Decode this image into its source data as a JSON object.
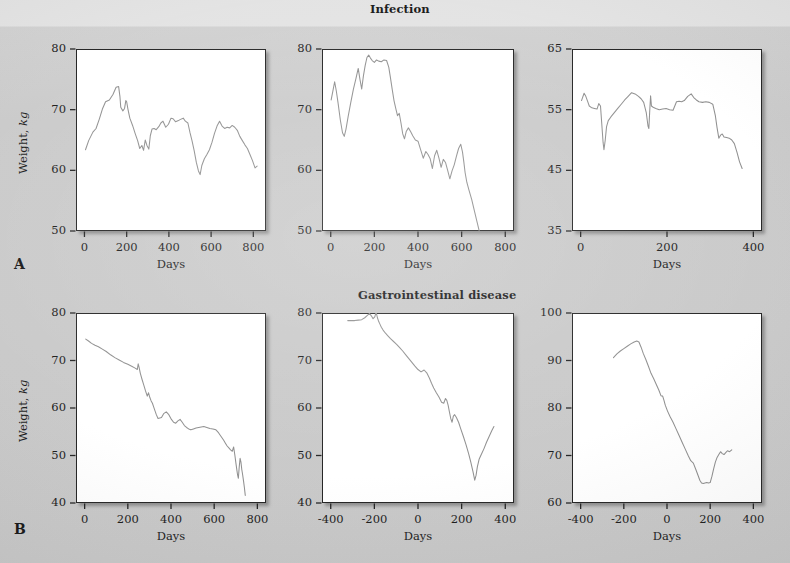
{
  "figure": {
    "background_color": "#c8c8c8",
    "series_color": "#8a8a8a",
    "frame_color": "#1b1b1b"
  },
  "sections": [
    {
      "id": "A",
      "label": "A",
      "title": "Infection"
    },
    {
      "id": "B",
      "label": "B",
      "title": "Gastrointestinal disease"
    }
  ],
  "axis_titles": {
    "x": "Days",
    "y_prefix": "Weight, ",
    "y_italic": "kg"
  },
  "chart_data": [
    {
      "id": "A1",
      "type": "line",
      "title": "",
      "section": "A",
      "xlabel": "Days",
      "ylabel": "Weight, kg",
      "xlim": [
        -40,
        860
      ],
      "ylim": [
        50,
        80
      ],
      "xticks": [
        0,
        200,
        400,
        600,
        800
      ],
      "yticks": [
        50,
        60,
        70,
        80
      ],
      "grid": false,
      "x": [
        5,
        20,
        40,
        55,
        70,
        85,
        100,
        118,
        135,
        150,
        162,
        168,
        172,
        182,
        190,
        196,
        200,
        206,
        215,
        228,
        240,
        252,
        262,
        272,
        280,
        288,
        296,
        305,
        312,
        320,
        330,
        340,
        352,
        362,
        372,
        385,
        398,
        410,
        420,
        432,
        445,
        455,
        468,
        478,
        490,
        500,
        510,
        520,
        530,
        540,
        548,
        556,
        568,
        580,
        592,
        604,
        616,
        628,
        640,
        652,
        664,
        676,
        688,
        700,
        712,
        724,
        736,
        748,
        760,
        772,
        784,
        796,
        808,
        818
      ],
      "y": [
        63.4,
        64.9,
        66.3,
        66.9,
        68.4,
        70.1,
        71.3,
        71.6,
        72.5,
        73.7,
        73.8,
        72.2,
        70.4,
        69.8,
        70.2,
        71.5,
        71.3,
        70.1,
        68.6,
        67.4,
        66.1,
        64.9,
        63.6,
        64.1,
        63.3,
        65.0,
        64.1,
        63.5,
        65.7,
        66.8,
        66.9,
        66.7,
        67.2,
        67.8,
        68.1,
        67.1,
        67.6,
        68.6,
        68.5,
        68.0,
        68.2,
        68.4,
        68.6,
        68.1,
        67.8,
        66.2,
        64.8,
        63.2,
        61.3,
        59.9,
        59.3,
        60.8,
        61.9,
        62.6,
        63.4,
        64.6,
        66.1,
        67.3,
        68.1,
        67.3,
        66.9,
        67.1,
        67.0,
        67.4,
        67.1,
        66.6,
        65.6,
        64.9,
        64.2,
        63.6,
        62.6,
        61.6,
        60.4,
        60.7
      ]
    },
    {
      "id": "A2",
      "type": "line",
      "title": "Infection",
      "section": "A",
      "xlabel": "Days",
      "ylabel": "",
      "xlim": [
        -40,
        840
      ],
      "ylim": [
        50,
        80
      ],
      "xticks": [
        0,
        200,
        400,
        600,
        800
      ],
      "yticks": [
        50,
        60,
        70,
        80
      ],
      "grid": false,
      "x": [
        2,
        10,
        18,
        26,
        34,
        44,
        54,
        62,
        70,
        80,
        92,
        104,
        116,
        126,
        134,
        142,
        150,
        158,
        166,
        174,
        182,
        190,
        200,
        210,
        220,
        232,
        244,
        256,
        266,
        274,
        282,
        290,
        298,
        306,
        314,
        322,
        330,
        338,
        346,
        356,
        366,
        376,
        388,
        400,
        412,
        424,
        436,
        446,
        456,
        466,
        476,
        486,
        496,
        506,
        516,
        526,
        536,
        546,
        556,
        566,
        576,
        586,
        596,
        604,
        610,
        616,
        624,
        634,
        646,
        658,
        670,
        680
      ],
      "y": [
        71.6,
        73.1,
        74.6,
        73.0,
        71.0,
        68.3,
        66.2,
        65.6,
        66.8,
        68.9,
        71.2,
        73.4,
        75.2,
        76.8,
        75.0,
        73.4,
        75.6,
        77.3,
        78.6,
        79.0,
        78.5,
        78.1,
        77.8,
        78.2,
        78.0,
        77.9,
        78.2,
        78.1,
        77.0,
        75.2,
        73.3,
        71.5,
        70.2,
        69.0,
        69.4,
        67.8,
        66.0,
        65.2,
        66.4,
        67.0,
        66.4,
        65.7,
        65.0,
        64.8,
        63.4,
        62.0,
        63.1,
        62.6,
        61.9,
        60.3,
        62.4,
        63.3,
        62.0,
        60.5,
        61.8,
        61.3,
        60.0,
        58.6,
        59.9,
        60.9,
        62.3,
        63.6,
        64.3,
        63.0,
        61.4,
        59.6,
        58.0,
        56.7,
        55.2,
        53.4,
        51.6,
        50.1
      ]
    },
    {
      "id": "A3",
      "type": "line",
      "title": "",
      "section": "A",
      "xlabel": "Days",
      "ylabel": "",
      "xlim": [
        -20,
        420
      ],
      "ylim": [
        35,
        65
      ],
      "xticks": [
        0,
        200,
        400
      ],
      "yticks": [
        35,
        45,
        55,
        65
      ],
      "grid": false,
      "x": [
        2,
        8,
        12,
        16,
        20,
        26,
        32,
        38,
        42,
        46,
        49,
        52,
        54,
        57,
        60,
        64,
        70,
        78,
        86,
        94,
        102,
        110,
        118,
        126,
        134,
        140,
        146,
        152,
        156,
        158,
        160,
        162,
        164,
        168,
        174,
        182,
        190,
        198,
        206,
        214,
        222,
        228,
        234,
        240,
        248,
        256,
        262,
        268,
        274,
        282,
        290,
        298,
        306,
        312,
        316,
        320,
        324,
        328,
        332,
        338,
        344,
        350,
        356,
        362,
        368,
        374
      ],
      "y": [
        56.5,
        57.7,
        57.2,
        56.4,
        55.6,
        55.3,
        55.2,
        55.1,
        56.0,
        55.6,
        52.6,
        49.6,
        48.4,
        50.0,
        52.2,
        53.2,
        53.8,
        54.5,
        55.2,
        55.9,
        56.6,
        57.2,
        57.8,
        57.6,
        57.2,
        56.8,
        56.2,
        54.5,
        52.3,
        51.9,
        54.8,
        57.3,
        55.6,
        55.4,
        55.2,
        55.0,
        55.1,
        55.2,
        55.0,
        54.9,
        56.3,
        56.4,
        56.3,
        56.5,
        57.2,
        57.6,
        57.0,
        56.6,
        56.3,
        56.2,
        56.3,
        56.2,
        55.9,
        54.0,
        52.0,
        50.3,
        50.8,
        51.0,
        50.5,
        50.4,
        50.3,
        50.0,
        49.4,
        48.0,
        46.4,
        45.3
      ]
    },
    {
      "id": "B1",
      "type": "line",
      "title": "",
      "section": "B",
      "xlabel": "Days",
      "ylabel": "Weight, kg",
      "xlim": [
        -40,
        840
      ],
      "ylim": [
        40,
        80
      ],
      "xticks": [
        0,
        200,
        400,
        600,
        800
      ],
      "yticks": [
        40,
        50,
        60,
        70,
        80
      ],
      "grid": false,
      "x": [
        5,
        18,
        32,
        48,
        64,
        82,
        100,
        120,
        140,
        160,
        180,
        200,
        218,
        234,
        244,
        248,
        252,
        258,
        266,
        274,
        282,
        290,
        296,
        302,
        308,
        314,
        320,
        326,
        332,
        340,
        348,
        356,
        366,
        378,
        390,
        402,
        412,
        422,
        432,
        442,
        452,
        462,
        472,
        482,
        492,
        504,
        516,
        528,
        540,
        552,
        566,
        580,
        594,
        608,
        620,
        632,
        644,
        652,
        660,
        668,
        676,
        684,
        690,
        696,
        700,
        704,
        708,
        712,
        716,
        720,
        724,
        728,
        732,
        736,
        740,
        744
      ],
      "y": [
        74.5,
        74.1,
        73.6,
        73.2,
        72.9,
        72.4,
        71.9,
        71.2,
        70.6,
        70.1,
        69.6,
        69.2,
        68.8,
        68.4,
        68.1,
        69.3,
        68.6,
        67.3,
        66.0,
        64.8,
        63.6,
        62.5,
        63.2,
        62.2,
        61.5,
        61.0,
        60.2,
        59.4,
        58.6,
        57.8,
        57.9,
        58.0,
        58.8,
        59.2,
        58.6,
        57.6,
        57.0,
        56.8,
        57.3,
        57.6,
        57.0,
        56.3,
        55.9,
        55.6,
        55.4,
        55.6,
        55.8,
        55.9,
        56.0,
        56.1,
        55.9,
        55.7,
        55.6,
        55.4,
        54.8,
        54.0,
        53.2,
        52.6,
        52.0,
        51.6,
        51.2,
        50.9,
        51.8,
        50.0,
        48.6,
        47.3,
        46.0,
        45.2,
        47.6,
        49.4,
        48.6,
        47.0,
        45.9,
        44.6,
        43.2,
        41.6
      ]
    },
    {
      "id": "B2",
      "type": "line",
      "title": "Gastrointestinal disease",
      "section": "B",
      "xlabel": "Days",
      "ylabel": "",
      "xlim": [
        -440,
        440
      ],
      "ylim": [
        40,
        80
      ],
      "xticks": [
        -400,
        -200,
        0,
        200,
        400
      ],
      "yticks": [
        40,
        50,
        60,
        70,
        80
      ],
      "grid": false,
      "x": [
        -322,
        -306,
        -290,
        -274,
        -258,
        -244,
        -232,
        -222,
        -214,
        -206,
        -198,
        -192,
        -186,
        -180,
        -174,
        -168,
        -160,
        -150,
        -138,
        -126,
        -112,
        -98,
        -84,
        -70,
        -56,
        -42,
        -28,
        -14,
        0,
        14,
        28,
        40,
        52,
        62,
        72,
        84,
        96,
        108,
        118,
        126,
        132,
        138,
        144,
        150,
        156,
        162,
        168,
        176,
        186,
        196,
        208,
        220,
        232,
        242,
        252,
        260,
        266,
        272,
        280,
        290,
        302,
        314,
        326,
        338,
        348
      ],
      "y": [
        78.4,
        78.4,
        78.4,
        78.5,
        78.6,
        79.0,
        79.5,
        79.9,
        79.4,
        78.8,
        79.2,
        80.2,
        79.0,
        78.2,
        77.6,
        77.0,
        76.4,
        75.8,
        75.2,
        74.6,
        74.0,
        73.4,
        72.7,
        72.0,
        71.2,
        70.4,
        69.6,
        68.8,
        68.1,
        67.6,
        68.0,
        67.4,
        66.3,
        65.2,
        64.2,
        63.2,
        62.3,
        61.2,
        61.0,
        62.0,
        61.6,
        60.6,
        59.2,
        57.8,
        57.0,
        58.3,
        58.6,
        58.0,
        57.0,
        55.6,
        54.0,
        52.3,
        50.4,
        48.6,
        46.6,
        44.8,
        45.8,
        47.6,
        49.2,
        50.2,
        51.4,
        52.8,
        54.0,
        55.2,
        56.1
      ]
    },
    {
      "id": "B3",
      "type": "line",
      "title": "",
      "section": "B",
      "xlabel": "Days",
      "ylabel": "",
      "xlim": [
        -440,
        440
      ],
      "ylim": [
        60,
        100
      ],
      "xticks": [
        -400,
        -200,
        0,
        200,
        400
      ],
      "yticks": [
        60,
        70,
        80,
        90,
        100
      ],
      "grid": false,
      "x": [
        -248,
        -232,
        -216,
        -200,
        -184,
        -168,
        -152,
        -140,
        -130,
        -120,
        -110,
        -98,
        -86,
        -74,
        -62,
        -50,
        -38,
        -28,
        -20,
        -14,
        -8,
        2,
        14,
        28,
        42,
        56,
        70,
        84,
        98,
        110,
        122,
        134,
        144,
        152,
        160,
        168,
        176,
        184,
        192,
        200,
        208,
        216,
        224,
        232,
        240,
        248,
        256,
        264,
        272,
        280,
        290,
        300
      ],
      "y": [
        90.6,
        91.4,
        92.0,
        92.5,
        93.0,
        93.5,
        93.9,
        94.1,
        93.9,
        92.8,
        91.5,
        90.2,
        88.8,
        87.3,
        86.2,
        85.0,
        83.8,
        82.6,
        82.5,
        81.6,
        80.6,
        79.4,
        78.2,
        77.0,
        75.6,
        74.2,
        72.8,
        71.4,
        70.0,
        68.9,
        68.4,
        67.0,
        65.8,
        64.8,
        64.2,
        64.1,
        64.2,
        64.3,
        64.2,
        64.3,
        65.6,
        67.2,
        68.6,
        69.6,
        70.2,
        70.8,
        70.4,
        70.2,
        70.6,
        71.0,
        70.8,
        71.2
      ]
    }
  ]
}
